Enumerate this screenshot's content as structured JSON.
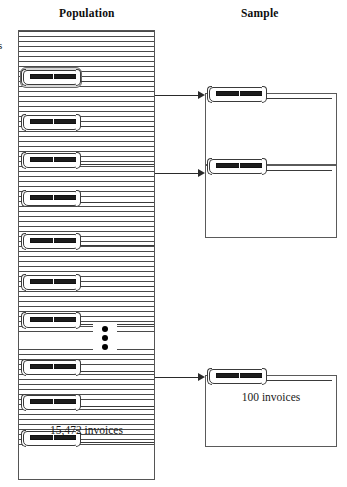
{
  "diagram": {
    "title_population": "Population",
    "title_sample": "Sample",
    "clipped_left_label": "s",
    "population": {
      "count_label": "15,472 invoices",
      "record_icon_name": "invoice-document-icon",
      "ellipsis_symbol": "vertical-ellipsis",
      "records": [
        {
          "index": 1,
          "highlighted": true,
          "top": 38
        },
        {
          "index": 2,
          "highlighted": false,
          "top": 83
        },
        {
          "index": 3,
          "highlighted": false,
          "top": 121
        },
        {
          "index": 4,
          "highlighted": false,
          "top": 159
        },
        {
          "index": 5,
          "highlighted": false,
          "top": 202
        },
        {
          "index": 6,
          "highlighted": false,
          "top": 243
        },
        {
          "index": 7,
          "highlighted": false,
          "top": 281
        },
        {
          "index": 8,
          "highlighted": false,
          "top": 328
        },
        {
          "index": 9,
          "highlighted": false,
          "top": 363
        },
        {
          "index": 10,
          "highlighted": false,
          "top": 399
        }
      ],
      "ellipsis_dots": 3
    },
    "sample": {
      "count_label": "100 invoices",
      "boxes": [
        {
          "index": 1,
          "label": ""
        },
        {
          "index": 2,
          "label": ""
        },
        {
          "index": 3,
          "label": "100 invoices"
        }
      ]
    },
    "arrows": [
      {
        "index": 1,
        "from": "population",
        "to": "sample-box-1"
      },
      {
        "index": 2,
        "from": "population",
        "to": "sample-box-2"
      },
      {
        "index": 3,
        "from": "population",
        "to": "sample-box-3"
      }
    ]
  },
  "colors": {
    "ink": "#1a1a1a",
    "rule_line": "#4a4a4a",
    "box_border": "#5a5a5a",
    "icon_bar": "#1c1c1c",
    "highlight_fill": "#d8d8d8",
    "arrow": "#2a2a2a",
    "paper": "#ffffff"
  }
}
